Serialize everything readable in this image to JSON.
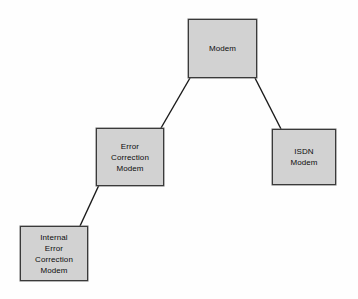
{
  "diagram": {
    "background_color": "#fefefe",
    "node_fill_color": "#d2d2d2",
    "node_border_color": "#3a3a3a",
    "connector_color": "#1a1a1a",
    "text_color": "#0d0d0d",
    "nodes": [
      {
        "id": "modem",
        "label": "Modem",
        "lines": [
          "Modem"
        ],
        "x": 188,
        "y": 19,
        "width": 69,
        "height": 59
      },
      {
        "id": "error-correction-modem",
        "label": "Error Correction Modem",
        "lines": [
          "Error",
          "Correction",
          "Modem"
        ],
        "x": 96,
        "y": 128,
        "width": 68,
        "height": 58
      },
      {
        "id": "isdn-modem",
        "label": "ISDN Modem",
        "lines": [
          "ISDN",
          "Modem"
        ],
        "x": 272,
        "y": 129,
        "width": 64,
        "height": 56
      },
      {
        "id": "internal-error-correction-modem",
        "label": "Internal Error Correction Modem",
        "lines": [
          "Internal",
          "Error",
          "Correction",
          "Modem"
        ],
        "x": 20,
        "y": 226,
        "width": 68,
        "height": 55
      }
    ],
    "connectors": [
      {
        "id": "modem-to-error-correction-modem",
        "from": "modem",
        "to": "error-correction-modem",
        "x1": 190,
        "y1": 78,
        "x2": 161,
        "y2": 128
      },
      {
        "id": "modem-to-isdn-modem",
        "from": "modem",
        "to": "isdn-modem",
        "x1": 255,
        "y1": 78,
        "x2": 281,
        "y2": 129
      },
      {
        "id": "error-correction-modem-to-internal",
        "from": "error-correction-modem",
        "to": "internal-error-correction-modem",
        "x1": 99,
        "y1": 185,
        "x2": 80,
        "y2": 226
      }
    ]
  }
}
